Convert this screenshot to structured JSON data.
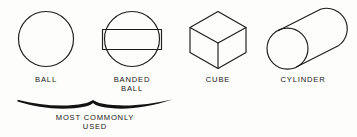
{
  "figure": {
    "background_color": "#fdfdfc",
    "line_color": "#1d1d1d",
    "text_color": "#171717",
    "shapes": [
      {
        "id": "ball",
        "icon": "circle-icon",
        "label": "BALL",
        "label_lines": [
          "BALL"
        ]
      },
      {
        "id": "banded-ball",
        "icon": "banded-circle-icon",
        "label": "BANDED BALL",
        "label_lines": [
          "BANDED",
          "BALL"
        ]
      },
      {
        "id": "cube",
        "icon": "isometric-cube-icon",
        "label": "CUBE",
        "label_lines": [
          "CUBE"
        ]
      },
      {
        "id": "cylinder",
        "icon": "tilted-cylinder-icon",
        "label": "CYLINDER",
        "label_lines": [
          "CYLINDER"
        ]
      }
    ],
    "annotation": {
      "brace": "horizontal-brace",
      "lines": [
        "MOST COMMONLY",
        "USED"
      ],
      "covers": [
        "BALL",
        "BANDED BALL"
      ]
    }
  }
}
